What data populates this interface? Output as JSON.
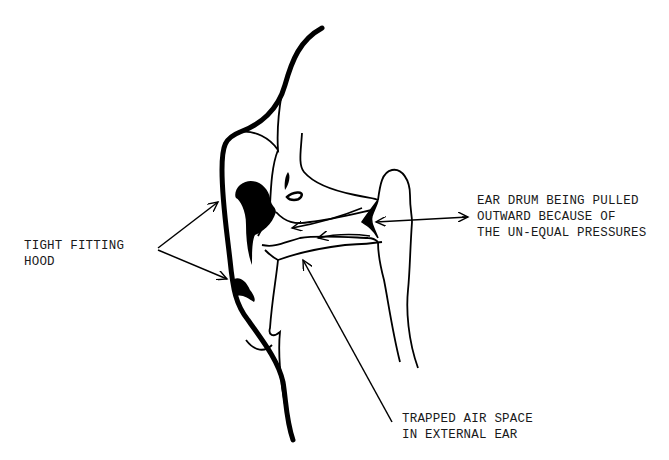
{
  "diagram": {
    "stroke_color": "#000000",
    "background_color": "#ffffff",
    "labels": {
      "hood": {
        "line1": "TIGHT FITTING",
        "line2": "HOOD"
      },
      "eardrum": {
        "line1": "EAR DRUM BEING PULLED",
        "line2": "OUTWARD BECAUSE OF",
        "line3": "THE UN-EQUAL PRESSURES"
      },
      "trapped_air": {
        "line1": "TRAPPED AIR SPACE",
        "line2": "IN EXTERNAL EAR"
      }
    }
  }
}
